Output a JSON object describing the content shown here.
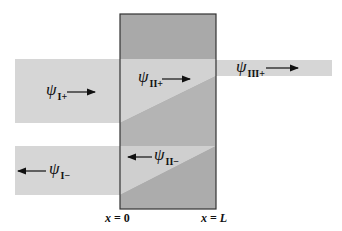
{
  "diagram": {
    "title": "",
    "colors": {
      "background": "#ffffff",
      "band_light": "#d6d6d6",
      "barrier_dark": "#a9a9a9",
      "barrier_mid": "#bdbdbd",
      "barrier_band_light": "#d2d2d2",
      "outline": "#333333",
      "text": "#111111"
    },
    "waves": [
      {
        "id": "psi_I_plus",
        "symbol": "ψ",
        "subscript": "I+",
        "direction": "right",
        "region": "I"
      },
      {
        "id": "psi_I_minus",
        "symbol": "ψ",
        "subscript": "I−",
        "direction": "left",
        "region": "I"
      },
      {
        "id": "psi_II_plus",
        "symbol": "ψ",
        "subscript": "II+",
        "direction": "right",
        "region": "II"
      },
      {
        "id": "psi_II_minus",
        "symbol": "ψ",
        "subscript": "II−",
        "direction": "left",
        "region": "II"
      },
      {
        "id": "psi_III_plus",
        "symbol": "ψ",
        "subscript": "III+",
        "direction": "right",
        "region": "III"
      }
    ],
    "axis_labels": {
      "left_boundary": {
        "var": "x",
        "eq": " = ",
        "val": "0"
      },
      "right_boundary": {
        "var": "x",
        "eq": " = ",
        "val": "L"
      }
    }
  }
}
